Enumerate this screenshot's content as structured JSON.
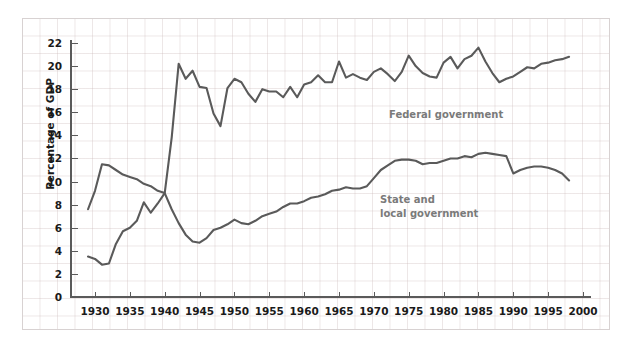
{
  "chart": {
    "ylabel": "Percentage of GDP",
    "xlabel": "",
    "title": "",
    "yticks": [
      "0",
      "2",
      "4",
      "6",
      "8",
      "10",
      "12",
      "14",
      "16",
      "18",
      "20",
      "22"
    ],
    "xticks": [
      "1930",
      "1935",
      "1940",
      "1945",
      "1950",
      "1955",
      "1960",
      "1965",
      "1970",
      "1975",
      "1980",
      "1985",
      "1990",
      "1995",
      "2000"
    ],
    "series_labels": {
      "federal": "Federal government",
      "state": "State and\nlocal government"
    },
    "colors": {
      "line": "#5a5a5a",
      "axis": "#5a5a5a",
      "grid": "#c4b0b0",
      "label": "#7a7a7a",
      "tick_text": "#1a1a1a",
      "background": "#ffffff",
      "frame": "#d8d2d2"
    }
  },
  "chart_data": {
    "type": "line",
    "title": "",
    "xlabel": "",
    "ylabel": "Percentage of GDP",
    "xlim": [
      1928,
      2000
    ],
    "ylim": [
      0,
      23
    ],
    "yticks": [
      0,
      2,
      4,
      6,
      8,
      10,
      12,
      14,
      16,
      18,
      20,
      22
    ],
    "xticks": [
      1930,
      1935,
      1940,
      1945,
      1950,
      1955,
      1960,
      1965,
      1970,
      1975,
      1980,
      1985,
      1990,
      1995,
      2000
    ],
    "grid": true,
    "legend": "inline-annotations",
    "x": [
      1929,
      1930,
      1931,
      1932,
      1933,
      1934,
      1935,
      1936,
      1937,
      1938,
      1939,
      1940,
      1941,
      1942,
      1943,
      1944,
      1945,
      1946,
      1947,
      1948,
      1949,
      1950,
      1951,
      1952,
      1953,
      1954,
      1955,
      1956,
      1957,
      1958,
      1959,
      1960,
      1961,
      1962,
      1963,
      1964,
      1965,
      1966,
      1967,
      1968,
      1969,
      1970,
      1971,
      1972,
      1973,
      1974,
      1975,
      1976,
      1977,
      1978,
      1979,
      1980,
      1981,
      1982,
      1983,
      1984,
      1985,
      1986,
      1987,
      1988,
      1989,
      1990,
      1991,
      1992,
      1993,
      1994,
      1995,
      1996,
      1997,
      1998
    ],
    "series": [
      {
        "name": "Federal government",
        "values": [
          3.5,
          3.3,
          2.8,
          2.9,
          4.6,
          5.7,
          6.0,
          6.6,
          8.2,
          7.3,
          8.1,
          9.0,
          13.8,
          20.2,
          18.9,
          19.6,
          18.2,
          18.1,
          15.9,
          14.8,
          18.1,
          18.9,
          18.6,
          17.6,
          16.9,
          18.0,
          17.8,
          17.8,
          17.3,
          18.2,
          17.3,
          18.4,
          18.6,
          19.2,
          18.6,
          18.6,
          20.4,
          19.0,
          19.3,
          19.0,
          18.8,
          19.5,
          19.8,
          19.3,
          18.7,
          19.5,
          20.9,
          20.0,
          19.4,
          19.1,
          19.0,
          20.3,
          20.8,
          19.8,
          20.6,
          20.9,
          21.6,
          20.4,
          19.4,
          18.6,
          18.9,
          19.1,
          19.5,
          19.9,
          19.8,
          20.2,
          20.3,
          20.5,
          20.6,
          20.8
        ]
      },
      {
        "name": "State and local government",
        "values": [
          7.6,
          9.2,
          11.5,
          11.4,
          11.0,
          10.6,
          10.4,
          10.2,
          9.8,
          9.6,
          9.2,
          9.0,
          7.6,
          6.4,
          5.4,
          4.8,
          4.7,
          5.1,
          5.8,
          6.0,
          6.3,
          6.7,
          6.4,
          6.3,
          6.6,
          7.0,
          7.2,
          7.4,
          7.8,
          8.1,
          8.1,
          8.3,
          8.6,
          8.7,
          8.9,
          9.2,
          9.3,
          9.5,
          9.4,
          9.4,
          9.6,
          10.3,
          11.0,
          11.4,
          11.8,
          11.9,
          11.9,
          11.8,
          11.5,
          11.6,
          11.6,
          11.8,
          12.0,
          12.0,
          12.2,
          12.1,
          12.4,
          12.5,
          12.4,
          12.3,
          12.2,
          10.7,
          11.0,
          11.2,
          11.3,
          11.3,
          11.2,
          11.0,
          10.7,
          10.1
        ]
      }
    ]
  }
}
